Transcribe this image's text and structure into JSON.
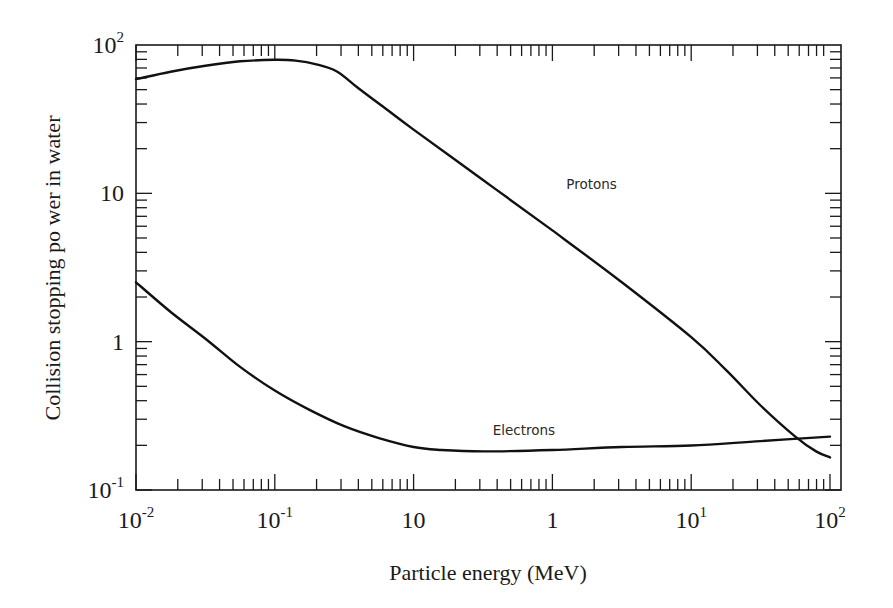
{
  "chart_data": {
    "type": "line",
    "title": "",
    "xlabel": "Particle energy (MeV)",
    "ylabel": "Collision stopping po wer in water",
    "xscale": "log",
    "yscale": "log",
    "x_tick_labels": [
      {
        "base": "10",
        "sup": "-2"
      },
      {
        "base": "10",
        "sup": "-1"
      },
      {
        "base": "10",
        "sup": ""
      },
      {
        "base": "1",
        "sup": ""
      },
      {
        "base": "10",
        "sup": "1"
      },
      {
        "base": "10",
        "sup": "2"
      }
    ],
    "y_tick_labels": [
      {
        "base": "10",
        "sup": "2"
      },
      {
        "base": "10",
        "sup": ""
      },
      {
        "base": "1",
        "sup": ""
      },
      {
        "base": "10",
        "sup": "-1"
      }
    ],
    "x_decade_positions": [
      0,
      1,
      2,
      3,
      4,
      5
    ],
    "ylim_log10": [
      -1,
      2
    ],
    "grid": false,
    "legend": "inline labels",
    "series": [
      {
        "name": "Protons",
        "label_position": {
          "x_decade": 3.1,
          "y_log10": 1.03
        },
        "points_decade_log10": [
          [
            0.0,
            1.77
          ],
          [
            0.25,
            1.82
          ],
          [
            0.5,
            1.86
          ],
          [
            0.75,
            1.89
          ],
          [
            1.0,
            1.9
          ],
          [
            1.15,
            1.895
          ],
          [
            1.3,
            1.87
          ],
          [
            1.45,
            1.82
          ],
          [
            1.6,
            1.71
          ],
          [
            1.8,
            1.57
          ],
          [
            2.0,
            1.43
          ],
          [
            2.5,
            1.09
          ],
          [
            3.0,
            0.75
          ],
          [
            3.5,
            0.4
          ],
          [
            4.0,
            0.03
          ],
          [
            4.25,
            -0.19
          ],
          [
            4.5,
            -0.43
          ],
          [
            4.75,
            -0.64
          ],
          [
            4.9,
            -0.74
          ],
          [
            5.0,
            -0.78
          ]
        ]
      },
      {
        "name": "Electrons",
        "label_position": {
          "x_decade": 2.57,
          "y_log10": -0.63
        },
        "points_decade_log10": [
          [
            0.0,
            0.4
          ],
          [
            0.25,
            0.2
          ],
          [
            0.5,
            0.02
          ],
          [
            0.75,
            -0.17
          ],
          [
            1.0,
            -0.33
          ],
          [
            1.25,
            -0.46
          ],
          [
            1.5,
            -0.57
          ],
          [
            1.75,
            -0.65
          ],
          [
            2.0,
            -0.71
          ],
          [
            2.2,
            -0.73
          ],
          [
            2.5,
            -0.74
          ],
          [
            3.0,
            -0.73
          ],
          [
            3.5,
            -0.71
          ],
          [
            4.0,
            -0.7
          ],
          [
            4.5,
            -0.67
          ],
          [
            5.0,
            -0.64
          ]
        ]
      }
    ]
  },
  "labels": {
    "xlabel": "Particle energy (MeV)",
    "ylabel": "Collision stopping po wer in water",
    "protons": "Protons",
    "electrons": "Electrons"
  },
  "colors": {
    "line": "#111111",
    "axis": "#1a1a1a",
    "background": "#ffffff"
  }
}
